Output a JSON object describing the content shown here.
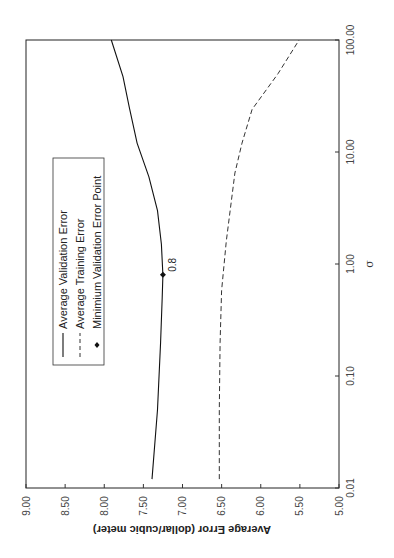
{
  "chart_data": {
    "type": "line",
    "orientation": "rotated-90-ccw",
    "title": "",
    "xlabel": "σ",
    "ylabel": "Average Error (dollar/cubic meter)",
    "xscale": "log",
    "xlim": [
      0.01,
      100
    ],
    "ylim": [
      5.0,
      9.0
    ],
    "xticks": [
      0.01,
      0.1,
      1,
      10,
      100
    ],
    "xtick_labels": [
      "0.01",
      "0.10",
      "1.00",
      "10.00",
      "100.00"
    ],
    "yticks": [
      5.0,
      5.5,
      6.0,
      6.5,
      7.0,
      7.5,
      8.0,
      8.5,
      9.0
    ],
    "ytick_labels": [
      "5.00",
      "5.50",
      "6.00",
      "6.50",
      "7.00",
      "7.50",
      "8.00",
      "8.50",
      "9.00"
    ],
    "grid": false,
    "legend_position": "upper-left (inside plot)",
    "series": [
      {
        "name": "Average Validation Error",
        "style": "solid",
        "x": [
          0.012,
          0.05,
          0.2,
          0.5,
          0.8,
          1.5,
          3,
          6,
          12,
          25,
          47,
          100
        ],
        "y": [
          7.39,
          7.32,
          7.28,
          7.26,
          7.25,
          7.27,
          7.32,
          7.43,
          7.58,
          7.68,
          7.76,
          7.91
        ]
      },
      {
        "name": "Average Training Error",
        "style": "dashed",
        "x": [
          0.012,
          0.05,
          0.2,
          0.58,
          1.6,
          6.5,
          12,
          24,
          50,
          100
        ],
        "y": [
          6.53,
          6.53,
          6.52,
          6.5,
          6.44,
          6.33,
          6.24,
          6.11,
          5.78,
          5.51
        ]
      }
    ],
    "markers": [
      {
        "name": "Minimium Validation Error Point",
        "x": 0.8,
        "y": 7.25,
        "label": "0.8"
      }
    ],
    "legend": [
      {
        "label": "Average Validation Error",
        "symbol": "solid-line"
      },
      {
        "label": "Average Training Error",
        "symbol": "dashed-line"
      },
      {
        "label": "Minimium Validation Error Point",
        "symbol": "diamond"
      }
    ]
  }
}
